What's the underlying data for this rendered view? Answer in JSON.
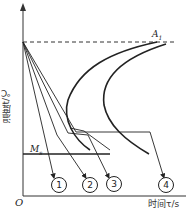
{
  "diagram": {
    "type": "CCT cooling curves diagram",
    "y_axis_label": "温度t/℃",
    "x_axis_label": "时间τ/s",
    "origin_label": "O",
    "a1_label": "A",
    "a1_subscript": "1",
    "ms_label": "M",
    "ms_subscript": "s",
    "curves": [
      {
        "id": "1",
        "label": "1",
        "symbol": "①"
      },
      {
        "id": "2",
        "label": "2",
        "symbol": "②"
      },
      {
        "id": "3",
        "label": "3",
        "symbol": "③"
      },
      {
        "id": "4",
        "label": "4",
        "symbol": "④"
      }
    ],
    "colors": {
      "line": "#222222",
      "background": "#ffffff"
    }
  }
}
